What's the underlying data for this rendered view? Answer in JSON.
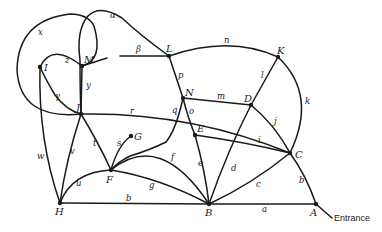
{
  "diagram": {
    "type": "graph",
    "nodes": [
      {
        "id": "A",
        "label": "A",
        "x": 316,
        "y": 204,
        "lx": 310,
        "ly": 216
      },
      {
        "id": "B",
        "label": "B",
        "x": 209,
        "y": 204,
        "lx": 205,
        "ly": 216
      },
      {
        "id": "C",
        "label": "C",
        "x": 290,
        "y": 153,
        "lx": 295,
        "ly": 158
      },
      {
        "id": "D",
        "label": "D",
        "x": 251,
        "y": 105,
        "lx": 244,
        "ly": 102
      },
      {
        "id": "E",
        "label": "E",
        "x": 195,
        "y": 135,
        "lx": 197,
        "ly": 132
      },
      {
        "id": "F",
        "label": "F",
        "x": 111,
        "y": 170,
        "lx": 106,
        "ly": 183
      },
      {
        "id": "G",
        "label": "G",
        "x": 131,
        "y": 136,
        "lx": 134,
        "ly": 140
      },
      {
        "id": "H",
        "label": "H",
        "x": 60,
        "y": 203,
        "lx": 55,
        "ly": 215
      },
      {
        "id": "I",
        "label": "I",
        "x": 40,
        "y": 67,
        "lx": 44,
        "ly": 71
      },
      {
        "id": "J",
        "label": "J",
        "x": 81,
        "y": 114,
        "lx": 76,
        "ly": 111
      },
      {
        "id": "K",
        "label": "K",
        "x": 278,
        "y": 57,
        "lx": 277,
        "ly": 54
      },
      {
        "id": "L",
        "label": "L",
        "x": 169,
        "y": 56,
        "lx": 166,
        "ly": 52
      },
      {
        "id": "M",
        "label": "M",
        "x": 82,
        "y": 66,
        "lx": 84,
        "ly": 63
      },
      {
        "id": "N",
        "label": "N",
        "x": 183,
        "y": 98,
        "lx": 185,
        "ly": 96
      }
    ],
    "edges": [
      {
        "label": "a",
        "from": "B",
        "to": "A",
        "path": "M209,204 L316,204",
        "lx": 262,
        "ly": 212
      },
      {
        "label": "b",
        "from": "H",
        "to": "B",
        "path": "M60,203 L209,204",
        "lx": 126,
        "ly": 201
      },
      {
        "label": "b",
        "from": "C",
        "to": "A",
        "path": "M290,153 Q306,175 316,204",
        "lx": 299,
        "ly": 183
      },
      {
        "label": "c",
        "from": "B",
        "to": "C",
        "path": "M209,204 Q252,184 290,153",
        "lx": 256,
        "ly": 187
      },
      {
        "label": "d",
        "from": "B",
        "to": "D",
        "path": "M209,204 Q228,150 251,105",
        "lx": 231,
        "ly": 171
      },
      {
        "label": "e",
        "from": "E",
        "to": "B",
        "path": "M195,135 Q205,170 209,204",
        "lx": 198,
        "ly": 166
      },
      {
        "label": "f",
        "from": "F",
        "to": "B",
        "path": "M111,170 Q160,130 209,204",
        "lx": 171,
        "ly": 160
      },
      {
        "label": "g",
        "from": "F",
        "to": "B",
        "path": "M111,170 Q160,178 209,204",
        "lx": 149,
        "ly": 188
      },
      {
        "label": "i",
        "from": "E",
        "to": "C",
        "path": "M195,135 Q245,142 290,153",
        "lx": 258,
        "ly": 143
      },
      {
        "label": "j",
        "from": "D",
        "to": "C",
        "path": "M251,105 Q275,125 290,153",
        "lx": 274,
        "ly": 124
      },
      {
        "label": "k",
        "from": "K",
        "to": "C",
        "path": "M278,57 Q318,95 290,153",
        "lx": 305,
        "ly": 104
      },
      {
        "label": "l",
        "from": "D",
        "to": "K",
        "path": "M251,105 L278,57",
        "lx": 261,
        "ly": 78
      },
      {
        "label": "m",
        "from": "N",
        "to": "D",
        "path": "M183,98 L251,105",
        "lx": 217,
        "ly": 99
      },
      {
        "label": "n",
        "from": "L",
        "to": "K",
        "path": "M169,56 Q230,35 278,57",
        "lx": 224,
        "ly": 43
      },
      {
        "label": "o",
        "from": "N",
        "to": "E",
        "path": "M183,98 Q188,118 195,135",
        "lx": 189,
        "ly": 114
      },
      {
        "label": "p",
        "from": "L",
        "to": "N",
        "path": "M169,56 L183,98",
        "lx": 178,
        "ly": 78
      },
      {
        "label": "q",
        "from": "N",
        "to": "F",
        "path": "M183,98 Q176,130 166,142 Q150,150 130,156 Q118,162 111,170",
        "lx": 172,
        "ly": 113
      },
      {
        "label": "r",
        "from": "J",
        "to": "C",
        "path": "M81,114 Q190,112 290,153",
        "lx": 130,
        "ly": 114
      },
      {
        "label": "s",
        "from": "F",
        "to": "G",
        "path": "M111,170 Q118,145 131,136",
        "lx": 117,
        "ly": 146
      },
      {
        "label": "t",
        "from": "J",
        "to": "F",
        "path": "M81,114 Q97,140 111,170",
        "lx": 93,
        "ly": 146
      },
      {
        "label": "u",
        "from": "H",
        "to": "F",
        "path": "M60,203 Q72,172 111,170",
        "lx": 76,
        "ly": 186
      },
      {
        "label": "v",
        "from": "J",
        "to": "H",
        "path": "M81,114 Q66,160 60,203",
        "lx": 70,
        "ly": 154
      },
      {
        "label": "w",
        "from": "I",
        "to": "H",
        "path": "M40,67 Q38,140 60,203",
        "lx": 37,
        "ly": 159
      },
      {
        "label": "x",
        "from": "J",
        "to": "M",
        "path": "M81,114 Q20,120 17,70 Q18,20 70,14 Q88,14 94,26 Q104,60 82,66",
        "lx": 38,
        "ly": 35
      },
      {
        "label": "y",
        "from": "M",
        "to": "J",
        "path": "M82,66 L81,114",
        "lx": 86,
        "ly": 88
      },
      {
        "label": "z",
        "from": "I",
        "to": "M",
        "path": "M40,67 Q52,42 82,66",
        "lx": 65,
        "ly": 63
      },
      {
        "label": "γ",
        "from": "I",
        "to": "J",
        "path": "M40,67 Q46,80 55,95 Q66,110 81,114",
        "lx": 55,
        "ly": 99
      },
      {
        "label": "α",
        "from": "L",
        "to": "J",
        "path": "M169,56 Q140,35 122,18 Q100,4 88,16 Q76,30 80,60 Q80,90 81,114",
        "lx": 110,
        "ly": 18
      },
      {
        "label": "β",
        "from": "M",
        "to": "L",
        "path": "M82,66 L107,58 M120,56 L169,56",
        "lx": 136,
        "ly": 52
      }
    ],
    "entrance": {
      "label": "Entrance",
      "x": 334,
      "y": 221,
      "path": "M316,204 L332,218"
    }
  }
}
